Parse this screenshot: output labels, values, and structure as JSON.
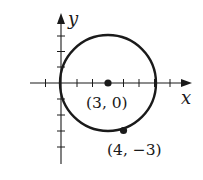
{
  "diagram": {
    "type": "circle-on-coordinate-plane",
    "axes": {
      "x_label": "x",
      "y_label": "y"
    },
    "circle": {
      "center": [
        3,
        0
      ],
      "point_on_circle": [
        4,
        -3
      ],
      "radius_squared": 10
    },
    "labels": {
      "center": "(3, 0)",
      "point": "(4, −3)"
    },
    "colors": {
      "stroke": "#1a1a1a",
      "background": "#ffffff"
    }
  }
}
